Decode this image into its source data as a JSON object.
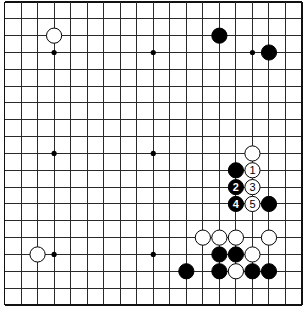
{
  "board": {
    "size": 19,
    "origin_x": 4.5,
    "origin_y": 2,
    "spacing_x": 16.53,
    "spacing_y": 16.83,
    "stone_radius": 7.6,
    "star_radius": 2.6,
    "colors": {
      "line": "#2a2a2a",
      "black": "#000000",
      "white": "#ffffff",
      "background": "#ffffff"
    },
    "star_points": [
      {
        "col": 3,
        "row": 3
      },
      {
        "col": 9,
        "row": 3
      },
      {
        "col": 15,
        "row": 3
      },
      {
        "col": 3,
        "row": 9
      },
      {
        "col": 9,
        "row": 9
      },
      {
        "col": 15,
        "row": 9
      },
      {
        "col": 3,
        "row": 15
      },
      {
        "col": 9,
        "row": 15
      },
      {
        "col": 15,
        "row": 15
      }
    ],
    "stones": [
      {
        "color": "white",
        "col": 3,
        "row": 2,
        "label": ""
      },
      {
        "color": "black",
        "col": 13,
        "row": 2,
        "label": ""
      },
      {
        "color": "black",
        "col": 16,
        "row": 3,
        "label": ""
      },
      {
        "color": "white",
        "col": 15,
        "row": 9,
        "label": ""
      },
      {
        "color": "black",
        "col": 14,
        "row": 10,
        "label": ""
      },
      {
        "color": "white",
        "col": 15,
        "row": 10,
        "label": "1"
      },
      {
        "color": "black",
        "col": 14,
        "row": 11,
        "label": "2"
      },
      {
        "color": "white",
        "col": 15,
        "row": 11,
        "label": "3"
      },
      {
        "color": "black",
        "col": 14,
        "row": 12,
        "label": "4"
      },
      {
        "color": "white",
        "col": 15,
        "row": 12,
        "label": "5"
      },
      {
        "color": "black",
        "col": 16,
        "row": 12,
        "label": ""
      },
      {
        "color": "white",
        "col": 12,
        "row": 14,
        "label": ""
      },
      {
        "color": "white",
        "col": 13,
        "row": 14,
        "label": ""
      },
      {
        "color": "white",
        "col": 14,
        "row": 14,
        "label": ""
      },
      {
        "color": "white",
        "col": 16,
        "row": 14,
        "label": ""
      },
      {
        "color": "white",
        "col": 2,
        "row": 15,
        "label": ""
      },
      {
        "color": "black",
        "col": 13,
        "row": 15,
        "label": ""
      },
      {
        "color": "black",
        "col": 14,
        "row": 15,
        "label": ""
      },
      {
        "color": "white",
        "col": 15,
        "row": 15,
        "label": ""
      },
      {
        "color": "black",
        "col": 11,
        "row": 16,
        "label": ""
      },
      {
        "color": "black",
        "col": 13,
        "row": 16,
        "label": ""
      },
      {
        "color": "white",
        "col": 14,
        "row": 16,
        "label": ""
      },
      {
        "color": "black",
        "col": 15,
        "row": 16,
        "label": ""
      },
      {
        "color": "black",
        "col": 16,
        "row": 16,
        "label": ""
      }
    ]
  }
}
